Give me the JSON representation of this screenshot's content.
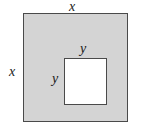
{
  "figure": {
    "kind": "geometry-diagram",
    "colors": {
      "outer_fill": "#d4d4d4",
      "inner_fill": "#ffffff",
      "stroke": "#4a4a4a",
      "label_color": "#1a1a1a",
      "background": "#ffffff"
    },
    "shapes": [
      {
        "name": "outer-square",
        "fill": "#d4d4d4",
        "side_label": "x"
      },
      {
        "name": "inner-square",
        "fill": "#ffffff",
        "side_label": "y"
      }
    ],
    "labels": {
      "outer_top": "x",
      "outer_left": "x",
      "inner_top": "y",
      "inner_left": "y"
    }
  }
}
